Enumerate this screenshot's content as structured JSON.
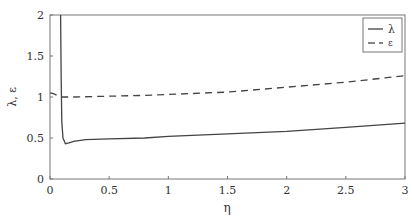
{
  "chart_data": {
    "type": "line",
    "title": "",
    "xlabel": "η",
    "ylabel": "λ, ε",
    "xlim": [
      0,
      3
    ],
    "ylim": [
      0,
      2
    ],
    "xticks": [
      "0",
      "0.5",
      "1",
      "1.5",
      "2",
      "2.5",
      "3"
    ],
    "yticks": [
      "0",
      "0.5",
      "1",
      "1.5",
      "2"
    ],
    "grid": false,
    "legend_position": "upper right",
    "series": [
      {
        "name": "λ",
        "style": "solid",
        "x": [
          0.09,
          0.095,
          0.1,
          0.11,
          0.13,
          0.16,
          0.2,
          0.3,
          0.5,
          0.8,
          1.0,
          1.5,
          2.0,
          2.5,
          3.0
        ],
        "y": [
          2.0,
          1.2,
          0.7,
          0.5,
          0.43,
          0.44,
          0.46,
          0.48,
          0.49,
          0.5,
          0.52,
          0.55,
          0.58,
          0.63,
          0.68
        ]
      },
      {
        "name": "ε",
        "style": "dashed",
        "x": [
          0.0,
          0.03,
          0.06,
          0.09,
          0.1,
          0.2,
          0.5,
          0.8,
          1.0,
          1.5,
          2.0,
          2.5,
          3.0
        ],
        "y": [
          1.05,
          1.04,
          1.02,
          1.0,
          1.0,
          1.0,
          1.01,
          1.02,
          1.03,
          1.06,
          1.12,
          1.18,
          1.26
        ]
      }
    ]
  },
  "legend": {
    "items": [
      {
        "label": "λ"
      },
      {
        "label": "ε"
      }
    ]
  },
  "axes": {
    "xlabel": "η",
    "ylabel": "λ, ε"
  }
}
